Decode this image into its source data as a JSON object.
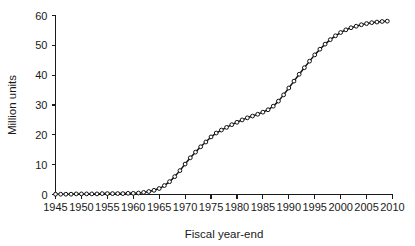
{
  "chart_data": {
    "type": "line",
    "title": "",
    "subtitle": "",
    "xlabel": "Fiscal year-end",
    "ylabel": "Million units",
    "xlim": [
      1945,
      2010
    ],
    "ylim": [
      0,
      60
    ],
    "xticks": [
      1945,
      1950,
      1955,
      1960,
      1965,
      1970,
      1975,
      1980,
      1985,
      1990,
      1995,
      2000,
      2005,
      2010
    ],
    "xtick_labels": [
      "1945",
      "1950",
      "1955",
      "1960",
      "1965",
      "1970",
      "1975",
      "1980",
      "1985",
      "1990",
      "1995",
      "2000",
      "2005",
      "2010"
    ],
    "yticks": [
      0,
      10,
      20,
      30,
      40,
      50,
      60
    ],
    "ytick_labels": [
      "0",
      "10",
      "20",
      "30",
      "40",
      "50",
      "60"
    ],
    "grid": false,
    "legend": false,
    "legend_position": "none",
    "marker": "open-circle",
    "line_color": "#111111",
    "marker_fill": "#ffffff",
    "marker_edge": "#111111",
    "background_color": "#ffffff",
    "x": [
      1945,
      1946,
      1947,
      1948,
      1949,
      1950,
      1951,
      1952,
      1953,
      1954,
      1955,
      1956,
      1957,
      1958,
      1959,
      1960,
      1961,
      1962,
      1963,
      1964,
      1965,
      1966,
      1967,
      1968,
      1969,
      1970,
      1971,
      1972,
      1973,
      1974,
      1975,
      1976,
      1977,
      1978,
      1979,
      1980,
      1981,
      1982,
      1983,
      1984,
      1985,
      1986,
      1987,
      1988,
      1989,
      1990,
      1991,
      1992,
      1993,
      1994,
      1995,
      1996,
      1997,
      1998,
      1999,
      2000,
      2001,
      2002,
      2003,
      2004,
      2005,
      2006,
      2007,
      2008,
      2009
    ],
    "values": [
      0.1,
      0.1,
      0.1,
      0.1,
      0.2,
      0.2,
      0.2,
      0.2,
      0.2,
      0.3,
      0.3,
      0.3,
      0.3,
      0.3,
      0.4,
      0.4,
      0.5,
      0.7,
      1.0,
      1.4,
      2.0,
      3.0,
      4.3,
      6.0,
      8.0,
      10.2,
      12.3,
      14.2,
      16.0,
      17.6,
      19.3,
      20.6,
      21.6,
      22.5,
      23.4,
      24.2,
      25.0,
      25.7,
      26.3,
      26.9,
      27.6,
      28.4,
      29.6,
      31.3,
      33.4,
      35.7,
      38.0,
      40.3,
      42.5,
      44.7,
      46.8,
      48.7,
      50.4,
      51.9,
      53.2,
      54.3,
      55.2,
      55.9,
      56.4,
      56.9,
      57.3,
      57.6,
      57.8,
      58.0,
      58.1
    ],
    "series": [
      {
        "name": "Cumulative units",
        "values": [
          0.1,
          0.1,
          0.1,
          0.1,
          0.2,
          0.2,
          0.2,
          0.2,
          0.2,
          0.3,
          0.3,
          0.3,
          0.3,
          0.3,
          0.4,
          0.4,
          0.5,
          0.7,
          1.0,
          1.4,
          2.0,
          3.0,
          4.3,
          6.0,
          8.0,
          10.2,
          12.3,
          14.2,
          16.0,
          17.6,
          19.3,
          20.6,
          21.6,
          22.5,
          23.4,
          24.2,
          25.0,
          25.7,
          26.3,
          26.9,
          27.6,
          28.4,
          29.6,
          31.3,
          33.4,
          35.7,
          38.0,
          40.3,
          42.5,
          44.7,
          46.8,
          48.7,
          50.4,
          51.9,
          53.2,
          54.3,
          55.2,
          55.9,
          56.4,
          56.9,
          57.3,
          57.6,
          57.8,
          58.0,
          58.1
        ]
      }
    ]
  }
}
